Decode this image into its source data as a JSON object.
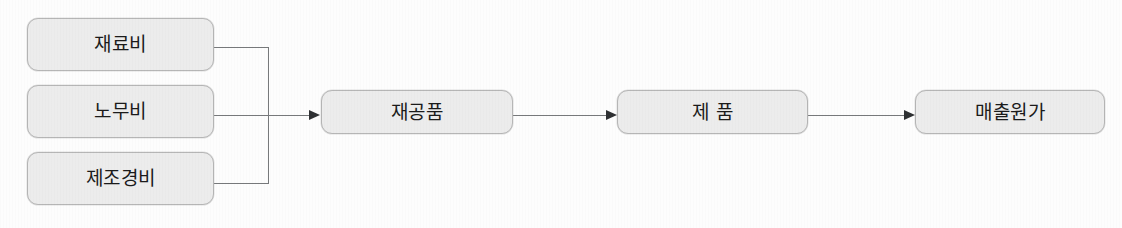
{
  "diagram": {
    "type": "flow-diagram",
    "background_color": "#fdfdfd",
    "node_fill_color": "#ececec",
    "node_border_color": "#b6b6b6",
    "connector_color": "#77797b",
    "arrow_color": "#2f3133",
    "text_color": "#1b1b1b",
    "inputs": [
      {
        "id": "material-cost",
        "label": "재료비"
      },
      {
        "id": "labor-cost",
        "label": "노무비"
      },
      {
        "id": "manufacturing-overhead",
        "label": "제조경비"
      }
    ],
    "stages": [
      {
        "id": "work-in-process",
        "label": "재공품"
      },
      {
        "id": "finished-goods",
        "label": "제 품"
      },
      {
        "id": "cost-of-goods-sold",
        "label": "매출원가"
      }
    ]
  }
}
